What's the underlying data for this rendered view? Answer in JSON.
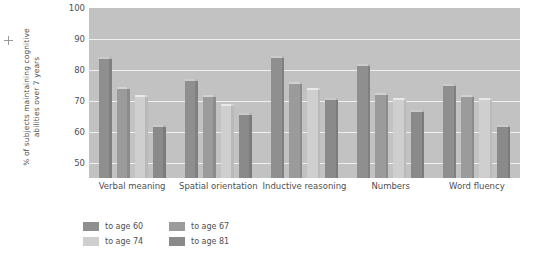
{
  "chart_data": {
    "type": "bar",
    "title": "",
    "xlabel": "",
    "ylabel": "% of subjects maintaining cognitive abilities over 7 years",
    "ylim": [
      45,
      100
    ],
    "yticks": [
      50,
      60,
      70,
      80,
      90,
      100
    ],
    "grid": true,
    "legend_position": "bottom-left",
    "categories": [
      "Verbal meaning",
      "Spatial orientation",
      "Inductive reasoning",
      "Numbers",
      "Word fluency"
    ],
    "series": [
      {
        "name": "to age 60",
        "color": "#8f8f8f",
        "values": [
          84,
          77,
          84.5,
          82,
          75.5
        ]
      },
      {
        "name": "to age 67",
        "color": "#9b9b9b",
        "values": [
          74.5,
          72,
          76,
          72.5,
          72
        ]
      },
      {
        "name": "to age 74",
        "color": "#cfcfcf",
        "values": [
          72,
          69,
          74,
          71,
          71
        ]
      },
      {
        "name": "to age 81",
        "color": "#8a8a8a",
        "values": [
          62,
          66,
          71,
          67,
          62
        ]
      }
    ]
  },
  "plot": {
    "background_color": "#c2c2c2",
    "gridline_color": "#efefef"
  },
  "legend": {
    "order": [
      {
        "name": "to age 60",
        "color": "#8f8f8f"
      },
      {
        "name": "to age 67",
        "color": "#9b9b9b"
      },
      {
        "name": "to age 74",
        "color": "#cfcfcf"
      },
      {
        "name": "to age 81",
        "color": "#8a8a8a"
      }
    ]
  }
}
